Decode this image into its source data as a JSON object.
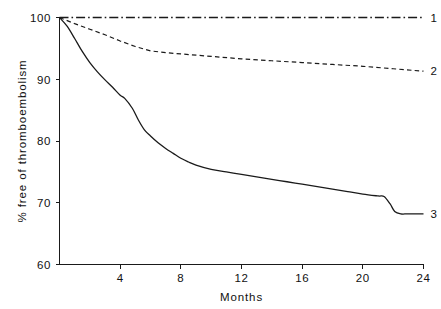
{
  "chart_data": {
    "type": "line",
    "title": "",
    "xlabel": "Months",
    "ylabel": "% free of thromboembolism",
    "xlim": [
      0,
      24
    ],
    "ylim": [
      60,
      100
    ],
    "xticks": [
      4,
      8,
      12,
      16,
      20,
      24
    ],
    "xtick_labels": [
      "4",
      "8",
      "12",
      "16",
      "20",
      "24"
    ],
    "yticks": [
      60,
      70,
      80,
      90,
      100
    ],
    "ytick_labels": [
      "60",
      "70",
      "80",
      "90",
      "100"
    ],
    "grid": false,
    "legend_position": "right-end-of-line",
    "series": [
      {
        "name": "1",
        "label": "1",
        "linestyle": "dashdot",
        "color": "#1a1a1a",
        "x": [
          0,
          2,
          4,
          6,
          8,
          10,
          12,
          14,
          16,
          18,
          20,
          22,
          24
        ],
        "values": [
          100,
          100,
          100,
          100,
          100,
          100,
          100,
          100,
          100,
          100,
          100,
          100,
          100
        ]
      },
      {
        "name": "2",
        "label": "2",
        "linestyle": "dashed",
        "color": "#1a1a1a",
        "x": [
          0,
          1,
          2,
          3,
          4,
          5,
          6,
          7,
          8,
          10,
          12,
          14,
          16,
          18,
          20,
          22,
          24
        ],
        "values": [
          100,
          99.0,
          98.1,
          97.2,
          96.2,
          95.3,
          94.6,
          94.3,
          94.1,
          93.7,
          93.3,
          93.0,
          92.7,
          92.4,
          92.1,
          91.7,
          91.3
        ]
      },
      {
        "name": "3",
        "label": "3",
        "linestyle": "solid",
        "color": "#1a1a1a",
        "x": [
          0,
          0.5,
          1,
          1.5,
          2,
          2.5,
          3,
          3.5,
          4,
          4.3,
          4.8,
          5.2,
          5.6,
          6,
          6.5,
          7,
          7.5,
          8,
          8.5,
          9,
          10,
          11,
          12,
          13,
          14,
          15,
          16,
          17,
          18,
          19,
          20,
          21,
          21.4,
          21.8,
          22.1,
          22.5,
          23,
          24
        ],
        "values": [
          100,
          98.6,
          96.6,
          94.5,
          92.7,
          91.2,
          89.9,
          88.7,
          87.4,
          86.9,
          85.3,
          83.4,
          81.8,
          80.8,
          79.7,
          78.8,
          78.0,
          77.2,
          76.6,
          76.1,
          75.4,
          75.0,
          74.6,
          74.2,
          73.8,
          73.4,
          73.0,
          72.6,
          72.2,
          71.8,
          71.4,
          71.1,
          71.0,
          69.8,
          68.6,
          68.2,
          68.2,
          68.2
        ]
      }
    ]
  },
  "axis": {
    "x_title": "Months",
    "y_title": "% free of thromboembolism"
  },
  "labels": {
    "series1": "1",
    "series2": "2",
    "series3": "3",
    "y_100": "100",
    "y_90": "90",
    "y_80": "80",
    "y_70": "70",
    "y_60": "60",
    "x_4": "4",
    "x_8": "8",
    "x_12": "12",
    "x_16": "16",
    "x_20": "20",
    "x_24": "24"
  },
  "colors": {
    "ink": "#1a1a1a",
    "background": "#ffffff"
  }
}
